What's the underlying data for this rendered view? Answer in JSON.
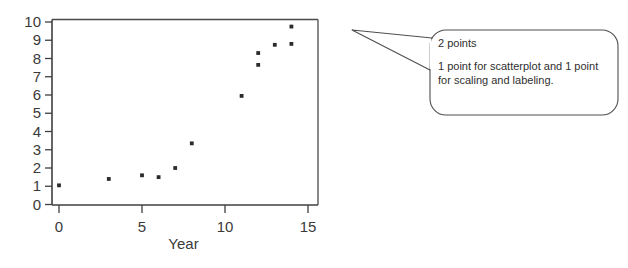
{
  "chart_data": {
    "type": "scatter",
    "title": "",
    "xlabel": "Year",
    "ylabel": "",
    "xlim": [
      0,
      15
    ],
    "ylim": [
      0,
      10
    ],
    "xticks": [
      0,
      5,
      10,
      15
    ],
    "yticks": [
      0,
      1,
      2,
      3,
      4,
      5,
      6,
      7,
      8,
      9,
      10
    ],
    "xtick_labels": [
      "0",
      "5",
      "10",
      "15"
    ],
    "ytick_labels": [
      "0",
      "1",
      "2",
      "3",
      "4",
      "5",
      "6",
      "7",
      "8",
      "9",
      "10"
    ],
    "grid": false,
    "legend": false,
    "marker": "square-dot",
    "marker_color": "#2b2b2b",
    "frame": "box",
    "points": [
      {
        "x": 0,
        "y": 1.05
      },
      {
        "x": 3,
        "y": 1.4
      },
      {
        "x": 5,
        "y": 1.6
      },
      {
        "x": 6,
        "y": 1.5
      },
      {
        "x": 7,
        "y": 2.0
      },
      {
        "x": 8,
        "y": 3.35
      },
      {
        "x": 11,
        "y": 5.95
      },
      {
        "x": 12,
        "y": 7.65
      },
      {
        "x": 12,
        "y": 8.3
      },
      {
        "x": 13,
        "y": 8.75
      },
      {
        "x": 14,
        "y": 8.8
      },
      {
        "x": 14,
        "y": 9.75
      }
    ]
  },
  "callout": {
    "heading": "2 points",
    "body_line_1": "1 point for scatterplot and 1 point",
    "body_line_2": "for scaling and labeling."
  },
  "colors": {
    "axis": "#3f3f3f",
    "marker": "#2b2b2b",
    "bubble_stroke": "#4f4f4f",
    "text": "#2f2f2f",
    "background": "#ffffff"
  }
}
